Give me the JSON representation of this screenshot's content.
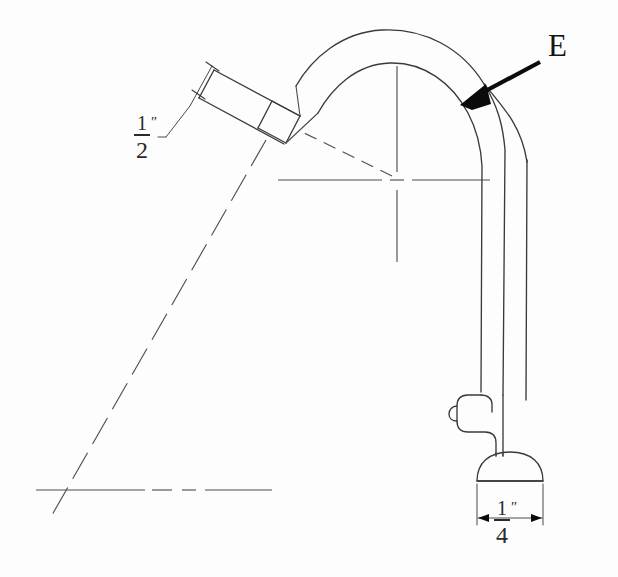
{
  "drawing": {
    "title": "Faucet Spout Technical Drawing",
    "background_color": "#fdfdfd",
    "line_color": "#3a3a3a",
    "annotation_color": "#0b0b0b",
    "callouts": [
      {
        "id": "E",
        "label": "E",
        "description": "leader arrow pointing to outer curve of goose-neck tube",
        "arrow_from": [
          540,
          62
        ],
        "arrow_to": [
          462,
          104
        ]
      }
    ],
    "dimensions": [
      {
        "id": "spout-diameter",
        "numerator": "1",
        "denominator": "2",
        "unit": "″",
        "value_text": "1/2″",
        "location": "angled spout nozzle width",
        "label_position": [
          134,
          113
        ]
      },
      {
        "id": "base-diameter",
        "numerator": "1",
        "denominator": "4",
        "unit": "″",
        "value_text": "1/4″",
        "location": "base flange width",
        "label_position": [
          494,
          498
        ]
      }
    ],
    "features": [
      {
        "name": "angled-spout-nozzle",
        "note": "rectangular tube angled up-left with collar ferrule"
      },
      {
        "name": "goose-neck-curve",
        "note": "concentric arcs forming curved tube"
      },
      {
        "name": "vertical-riser-tube",
        "note": "straight vertical double-line tube"
      },
      {
        "name": "lever-handle",
        "note": "rounded handle extending left"
      },
      {
        "name": "base-flange",
        "note": "dome shaped mounting base"
      },
      {
        "name": "center-crosshair",
        "note": "construction center of arc radius"
      },
      {
        "name": "lower-crosshair",
        "note": "secondary construction intersection"
      }
    ]
  }
}
